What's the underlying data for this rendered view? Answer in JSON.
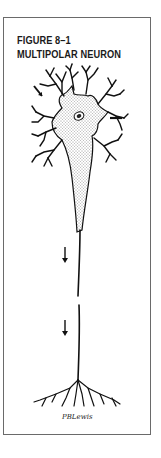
{
  "figure": {
    "label": "FIGURE 8–1",
    "title": "MULTIPOLAR NEURON",
    "signature": "PBLewis"
  },
  "illustration": {
    "subject": "multipolar neuron",
    "parts": [
      "dendrites",
      "cell body",
      "nucleus",
      "axon",
      "axon terminals"
    ],
    "arrows": [
      {
        "name": "dendrite-arrow",
        "direction": "down-right"
      },
      {
        "name": "cell-body-arrow",
        "direction": "left"
      },
      {
        "name": "axon-arrow-upper",
        "direction": "down"
      },
      {
        "name": "axon-arrow-lower",
        "direction": "down"
      }
    ],
    "colors": {
      "ink": "#111111",
      "border": "#6a6a6a",
      "background": "#ffffff"
    }
  }
}
